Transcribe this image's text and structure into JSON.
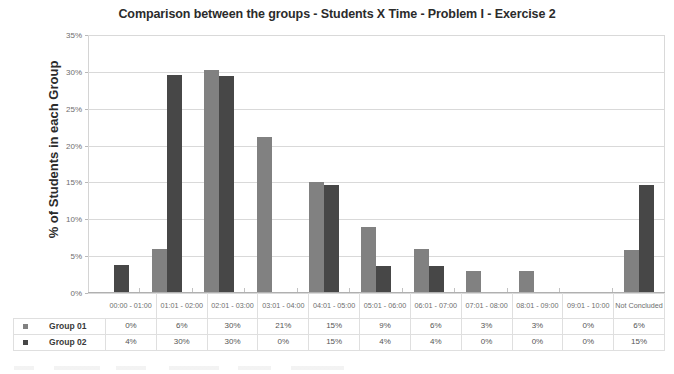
{
  "chart_data": {
    "type": "bar",
    "title": "Comparison between the groups - Students X Time - Problem I - Exercise 2",
    "xlabel": "",
    "ylabel": "% of Students in each Group",
    "ylim": [
      0,
      35
    ],
    "ytick_labels": [
      "35%",
      "30%",
      "25%",
      "20%",
      "15%",
      "10%",
      "5%",
      "0%"
    ],
    "ytick_values": [
      35,
      30,
      25,
      20,
      15,
      10,
      5,
      0
    ],
    "grid": true,
    "legend_position": "bottom-table",
    "categories": [
      "00:00 - 01:00",
      "01:01 - 02:00",
      "02:01 - 03:00",
      "03:01 - 04:00",
      "04:01 - 05:00",
      "05:01 - 06:00",
      "06:01 - 07:00",
      "07:01 - 08:00",
      "08:01 - 09:00",
      "09:01 - 10:00",
      "Not Concluded"
    ],
    "series": [
      {
        "name": "Group 01",
        "color": "#818181",
        "values": [
          0,
          6.0,
          30.2,
          21.1,
          15.0,
          9.0,
          6.0,
          3.0,
          3.0,
          0,
          5.8
        ],
        "labels": [
          "0%",
          "6%",
          "30%",
          "21%",
          "15%",
          "9%",
          "6%",
          "3%",
          "3%",
          "0%",
          "6%"
        ]
      },
      {
        "name": "Group 02",
        "color": "#474747",
        "values": [
          3.8,
          29.6,
          29.5,
          0,
          14.7,
          3.7,
          3.7,
          0,
          0,
          0,
          14.6
        ],
        "labels": [
          "4%",
          "30%",
          "30%",
          "0%",
          "15%",
          "4%",
          "4%",
          "0%",
          "0%",
          "0%",
          "15%"
        ]
      }
    ]
  },
  "table": {
    "corner_label": "",
    "swatch_icon": "legend-square-icon"
  }
}
